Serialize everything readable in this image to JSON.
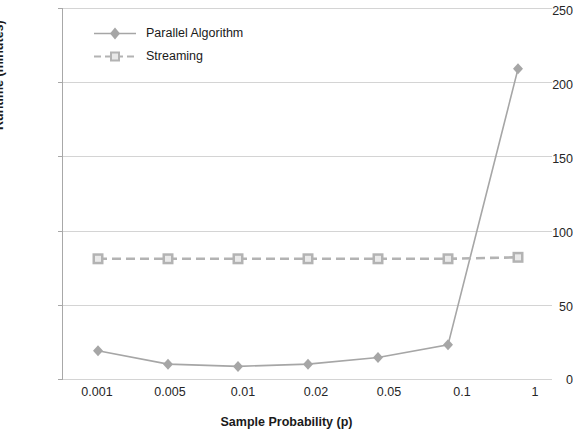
{
  "chart_data": {
    "type": "line",
    "title": "",
    "xlabel": "Sample Probability (p)",
    "ylabel": "Runtime (minutes)",
    "categories": [
      "0.001",
      "0.005",
      "0.01",
      "0.02",
      "0.05",
      "0.1",
      "1"
    ],
    "ylim": [
      0,
      250
    ],
    "yticks": [
      0,
      50,
      100,
      150,
      200,
      250
    ],
    "grid": "horizontal",
    "legend_position": "top-left",
    "series": [
      {
        "name": "Parallel Algorithm",
        "color": "#a6a6a6",
        "marker": "diamond",
        "linestyle": "solid",
        "values": [
          19,
          10,
          8.5,
          10,
          14.5,
          23,
          209
        ]
      },
      {
        "name": "Streaming",
        "color": "#b3b3b3",
        "marker": "square",
        "linestyle": "dashed",
        "values": [
          81,
          81,
          81,
          81,
          81,
          81,
          82
        ]
      }
    ]
  },
  "axes": {
    "y_tick_labels": [
      "0",
      "50",
      "100",
      "150",
      "200",
      "250"
    ],
    "x_tick_labels": [
      "0.001",
      "0.005",
      "0.01",
      "0.02",
      "0.05",
      "0.1",
      "1"
    ],
    "y_title": "Runtime (minutes)",
    "x_title": "Sample Probability (p)"
  },
  "legend": {
    "items": [
      {
        "label": "Parallel Algorithm"
      },
      {
        "label": "Streaming"
      }
    ]
  }
}
